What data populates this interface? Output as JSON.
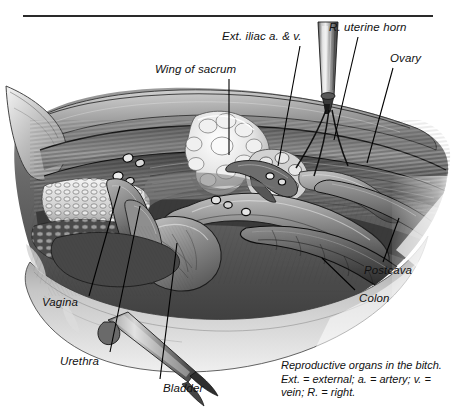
{
  "figure": {
    "title": "Reproductive organs in the bitch",
    "medium": "grayscale anatomical illustration"
  },
  "labels": [
    {
      "id": "ext-iliac",
      "text": "Ext. iliac a. & v.",
      "x": 222,
      "y": 30,
      "line": {
        "x1": 300,
        "y1": 46,
        "x2": 278,
        "y2": 166
      }
    },
    {
      "id": "r-uterine-horn",
      "text": "R. uterine horn",
      "x": 329,
      "y": 21,
      "line": {
        "x1": 358,
        "y1": 37,
        "x2": 334,
        "y2": 140
      }
    },
    {
      "id": "wing-of-sacrum",
      "text": "Wing of sacrum",
      "x": 155,
      "y": 63,
      "line": {
        "x1": 229,
        "y1": 79,
        "x2": 229,
        "y2": 155
      }
    },
    {
      "id": "ovary",
      "text": "Ovary",
      "x": 390,
      "y": 52,
      "line": {
        "x1": 393,
        "y1": 68,
        "x2": 367,
        "y2": 163
      }
    },
    {
      "id": "postcava",
      "text": "Postcava",
      "x": 364,
      "y": 264,
      "line": {
        "x1": 383,
        "y1": 262,
        "x2": 399,
        "y2": 218
      }
    },
    {
      "id": "colon",
      "text": "Colon",
      "x": 359,
      "y": 292,
      "line": {
        "x1": 355,
        "y1": 290,
        "x2": 322,
        "y2": 258
      }
    },
    {
      "id": "vagina",
      "text": "Vagina",
      "x": 42,
      "y": 296,
      "line": {
        "x1": 89,
        "y1": 296,
        "x2": 120,
        "y2": 186
      }
    },
    {
      "id": "urethra",
      "text": "Urethra",
      "x": 60,
      "y": 355,
      "line": {
        "x1": 110,
        "y1": 352,
        "x2": 140,
        "y2": 206
      }
    },
    {
      "id": "bladder",
      "text": "Bladder",
      "x": 163,
      "y": 382,
      "line": {
        "x1": 160,
        "y1": 379,
        "x2": 177,
        "y2": 243
      }
    }
  ],
  "caption": {
    "line1": "Reproductive organs in the bitch.",
    "line2": "Ext. = external; a. = artery; v. =",
    "line3": "vein; R. = right."
  },
  "colors": {
    "ink": "#111111",
    "rule": "#2a2a2a",
    "leader": "#000000",
    "paper": "#ffffff",
    "tissue_dark": "#2f2f2f",
    "tissue_mid": "#6e6e6e",
    "tissue_light": "#c9c9c9",
    "highlight": "#f2f2f2",
    "instrument": "#8f8f8f"
  }
}
